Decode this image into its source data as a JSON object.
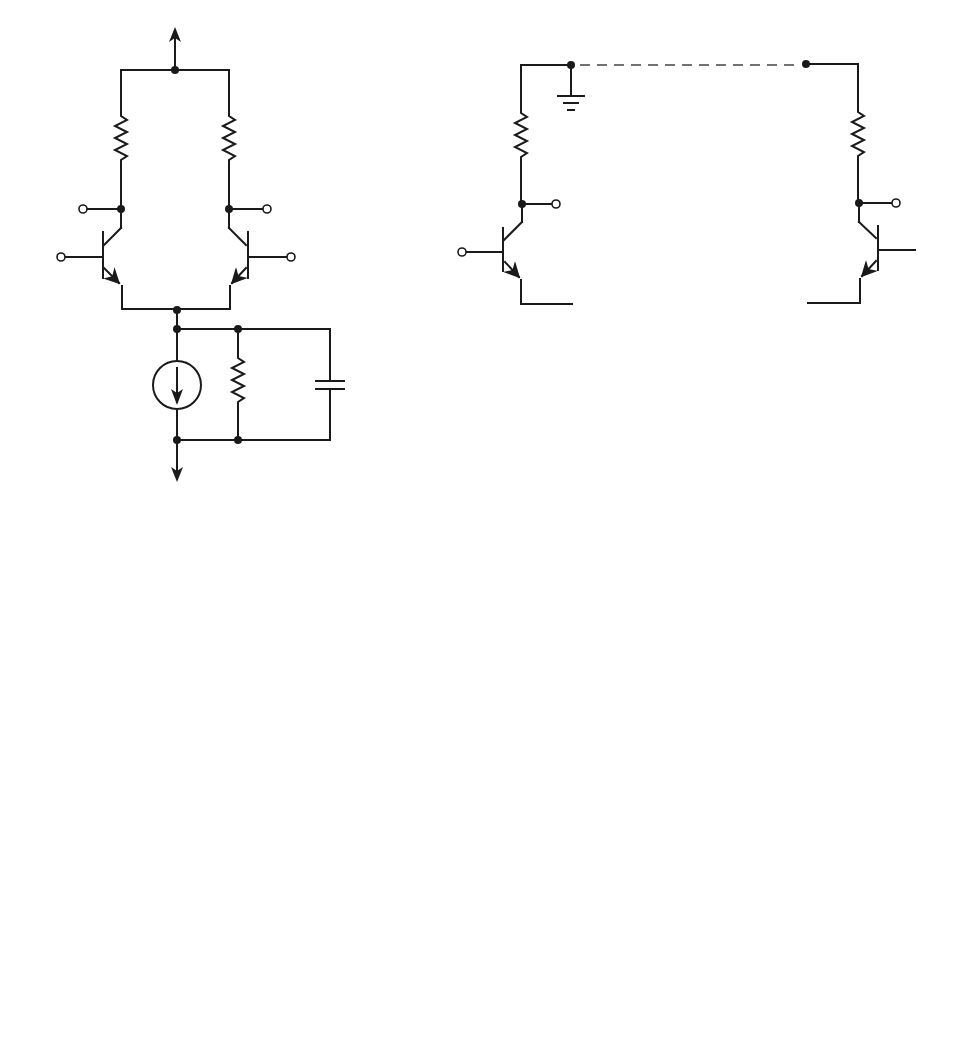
{
  "figure": {
    "panels": [
      {
        "id": "a",
        "caption": "(a)",
        "labels": {
          "rc_left": "R",
          "rc_left_sub": "C",
          "rc_right": "R",
          "rc_right_sub": "C",
          "vo_left": "V",
          "vo_left_sub": "o",
          "vo_right": "V",
          "vo_right_sub": "o",
          "vc_left": "V",
          "vc_left_sub": "C",
          "vc_right": "V",
          "vc_right_sub": "C",
          "rout": "R",
          "rout_sub": "out",
          "cout": "C",
          "cout_sub": "out"
        }
      },
      {
        "id": "b",
        "caption": "(b)",
        "labels": {
          "rc_left": "R",
          "rc_left_sub": "C",
          "rc_right": "R",
          "rc_right_sub": "C",
          "vo_left": "V",
          "vo_left_sub": "o",
          "vo_right": "V",
          "vo_right_sub": "o",
          "vc_left": "V",
          "vc_left_sub": "C",
          "vc_right": "V",
          "vc_right_sub": "C",
          "rout_left_coef": "2",
          "rout_left": "R",
          "rout_left_sub": "out",
          "rout_right_coef": "2",
          "rout_right": "R",
          "rout_right_sub": "out",
          "cout_left": "C",
          "cout_left_sub": "out",
          "cout_left_den": "2",
          "cout_right": "C",
          "cout_right_sub": "out",
          "cout_right_den": "2"
        }
      },
      {
        "id": "c",
        "caption": "(c)",
        "labels": {
          "rc": "R",
          "rc_sub": "C",
          "vo": "V",
          "vo_sub": "o",
          "vc": "V",
          "vc_sub": "C",
          "vc_plus": "+",
          "vc_minus": "−",
          "rpi": "r",
          "rpi_sub": "π",
          "vpi": "V",
          "vpi_sub": "π",
          "vpi_plus": "+",
          "vpi_minus": "−",
          "gm": "g",
          "gm_sub": "m",
          "gm_v": "V",
          "gm_v_sub": "π",
          "rout_coef": "2",
          "rout": "R",
          "rout_sub": "out",
          "cout": "C",
          "cout_sub": "out",
          "cout_den": "2"
        }
      }
    ]
  }
}
